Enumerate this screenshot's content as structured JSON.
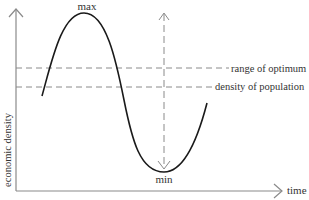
{
  "diagram": {
    "type": "conceptual-curve",
    "axes": {
      "y_label": "economic density",
      "x_label": "time"
    },
    "curve_labels": {
      "max": "max",
      "min": "min"
    },
    "reference_lines": [
      {
        "label": "range of optimum"
      },
      {
        "label": "density of population"
      }
    ],
    "colors": {
      "axis": "#8a8a8a",
      "curve": "#1a1a1a",
      "dashed": "#8a8a8a",
      "text": "#333333"
    }
  }
}
